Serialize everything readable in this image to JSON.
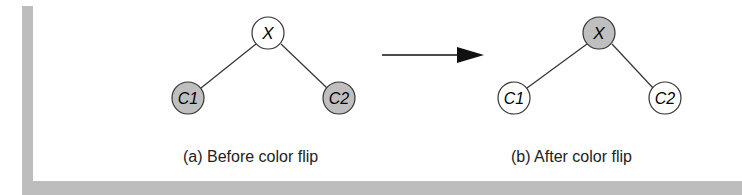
{
  "diagram": {
    "left": {
      "caption": "(a) Before color flip",
      "nodes": [
        {
          "label": "X",
          "fill": "#ffffff"
        },
        {
          "label": "C1",
          "fill": "#bfbfbf"
        },
        {
          "label": "C2",
          "fill": "#bfbfbf"
        }
      ]
    },
    "right": {
      "caption": "(b) After color flip",
      "nodes": [
        {
          "label": "X",
          "fill": "#bfbfbf"
        },
        {
          "label": "C1",
          "fill": "#ffffff"
        },
        {
          "label": "C2",
          "fill": "#ffffff"
        }
      ]
    },
    "arrow": "arrow-right"
  }
}
